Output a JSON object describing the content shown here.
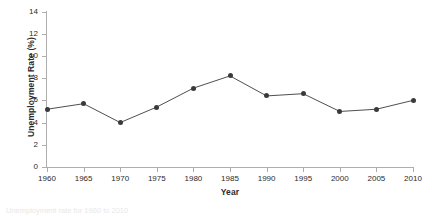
{
  "chart_data": {
    "type": "line",
    "title": "",
    "xlabel": "Year",
    "ylabel": "Unemployment Rate (%)",
    "x": [
      1960,
      1965,
      1970,
      1975,
      1980,
      1985,
      1990,
      1995,
      2000,
      2005,
      2010
    ],
    "values": [
      5.2,
      5.7,
      4.0,
      5.4,
      7.1,
      8.2,
      6.4,
      6.6,
      5.0,
      5.2,
      6.0
    ],
    "xtick_labels": [
      "1960",
      "1965",
      "1970",
      "1975",
      "1980",
      "1985",
      "1990",
      "1995",
      "2000",
      "2005",
      "2010"
    ],
    "ytick_labels": [
      "0",
      "2",
      "4",
      "6",
      "8",
      "10",
      "12",
      "14"
    ],
    "yticks": [
      0,
      2,
      4,
      6,
      8,
      10,
      12,
      14
    ],
    "ylim": [
      0,
      14
    ],
    "xlim": [
      1960,
      2010
    ],
    "grid": false,
    "legend": false,
    "marker": "circle",
    "series_color": "#3a3a3a",
    "axis_color": "#aeaeae",
    "background": "#ffffff"
  },
  "caption": {
    "text": "Unemployment rate for 1960 to 2010"
  }
}
